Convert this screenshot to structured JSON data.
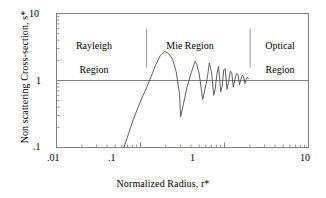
{
  "figure": {
    "background_color": "#ffffff",
    "frame_color": "#808080",
    "curve_color": "#4d4d4d",
    "reference_line_color": "#808080",
    "divider_color": "#999999",
    "text_color": "#000000"
  },
  "chart_data": {
    "type": "line",
    "title": "",
    "subtitle": "",
    "xlabel": "Normalized Radius, r*",
    "ylabel": "Non scattering Cross-section, s*",
    "xscale": "log",
    "yscale": "log",
    "xlim": [
      0.01,
      10
    ],
    "ylim": [
      0.1,
      10
    ],
    "xticks": [
      0.01,
      0.1,
      1,
      10
    ],
    "xticklabels": [
      ".01",
      ".1",
      "1",
      "10"
    ],
    "yticks": [
      0.1,
      1,
      10
    ],
    "yticklabels": [
      ".1",
      "1",
      "10"
    ],
    "minor_ticks": true,
    "grid": false,
    "legend": null,
    "reference_line": {
      "name": "unity-reference",
      "orientation": "horizontal",
      "y": 1.0,
      "x_start": 0.01,
      "x_end": 10
    },
    "annotations": [
      {
        "name": "rayleigh-region-label",
        "text": "Rayleigh\nRegion",
        "x": 0.027,
        "y": 5.0
      },
      {
        "name": "mie-region-label",
        "text": "Mie Region",
        "x": 0.42,
        "y": 5.3
      },
      {
        "name": "optical-region-label",
        "text": "Optical\nRegion",
        "x": 4.2,
        "y": 5.0
      }
    ],
    "dividers": [
      {
        "name": "rayleigh-mie-divider",
        "x": 0.118,
        "y_start": 1.55,
        "y_end": 5.9
      },
      {
        "name": "mie-optical-divider",
        "x": 2.02,
        "y_start": 1.55,
        "y_end": 5.9
      }
    ],
    "series": [
      {
        "name": "non-scattering-cross-section",
        "x": [
          0.0635,
          0.072,
          0.082,
          0.093,
          0.105,
          0.118,
          0.134,
          0.152,
          0.172,
          0.193,
          0.215,
          0.24,
          0.266,
          0.292,
          0.3,
          0.325,
          0.36,
          0.4,
          0.445,
          0.468,
          0.5,
          0.55,
          0.6,
          0.625,
          0.66,
          0.7,
          0.745,
          0.775,
          0.81,
          0.85,
          0.9,
          0.94,
          0.98,
          1.02,
          1.07,
          1.12,
          1.17,
          1.22,
          1.27,
          1.33,
          1.39,
          1.45,
          1.51,
          1.57,
          1.63,
          1.69,
          1.75,
          1.81,
          1.87,
          1.93
        ],
        "y": [
          0.1,
          0.16,
          0.26,
          0.39,
          0.56,
          0.78,
          1.15,
          1.72,
          2.35,
          2.72,
          2.55,
          2.1,
          1.35,
          0.62,
          0.285,
          0.45,
          0.82,
          1.28,
          1.92,
          1.74,
          1.25,
          0.52,
          0.86,
          1.1,
          1.82,
          1.36,
          0.6,
          0.75,
          1.22,
          1.62,
          0.68,
          0.82,
          1.45,
          1.5,
          0.74,
          0.95,
          1.38,
          1.32,
          0.8,
          1.02,
          1.28,
          1.22,
          0.86,
          1.06,
          1.2,
          1.14,
          0.9,
          1.04,
          1.12,
          1.06
        ]
      }
    ]
  },
  "axes": {
    "x": {
      "label": "Normalized Radius, r*",
      "tick_labels": [
        ".01",
        ".1",
        "1",
        "10"
      ]
    },
    "y": {
      "label": "Non scattering Cross-section, s*",
      "tick_labels": [
        "10",
        "1",
        ".1"
      ]
    }
  },
  "regions": {
    "rayleigh": {
      "line1": "Rayleigh",
      "line2": "Region"
    },
    "mie": {
      "line1": "Mie Region"
    },
    "optical": {
      "line1": "Optical",
      "line2": "Region"
    }
  }
}
